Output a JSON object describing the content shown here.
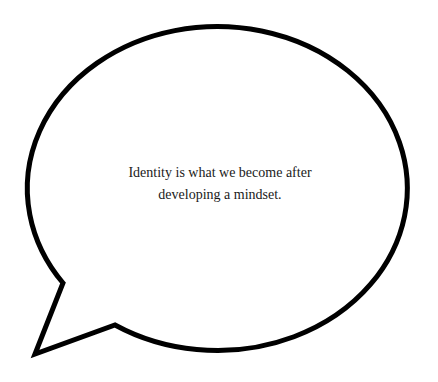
{
  "speech_bubble": {
    "text_lines": [
      "Identity is what we become after",
      "developing a mindset."
    ],
    "stroke_color": "#000000",
    "fill_color": "#ffffff",
    "text_color": "#1a1a1a"
  }
}
